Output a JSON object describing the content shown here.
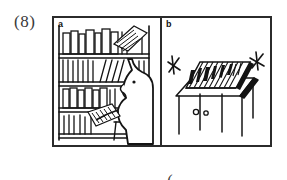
{
  "worksheet": {
    "item_number": "(8)",
    "caption": {
      "open_paren": "(",
      "option_a": "a",
      "option_b": "b",
      "close_paren": ")"
    }
  },
  "figure": {
    "panels": [
      {
        "label": "a",
        "description": "person standing at a tall bookshelf taking a book off the shelf",
        "elements": [
          "bookshelf-with-four-shelves",
          "row-of-upright-books",
          "person-silhouette",
          "book-in-hand",
          "book-being-pulled-from-top-shelf",
          "chair"
        ]
      },
      {
        "label": "b",
        "description": "row of books standing on a table or cabinet with motion marks",
        "elements": [
          "table",
          "row-of-books-on-table",
          "cabinet-doors",
          "two-door-knobs",
          "motion-mark-left",
          "motion-mark-right"
        ]
      }
    ]
  },
  "style": {
    "ink_color": "#1a1a1a",
    "frame_color": "#2b2b2b",
    "paper_color": "#ffffff",
    "text_color": "#3a3a3a"
  }
}
